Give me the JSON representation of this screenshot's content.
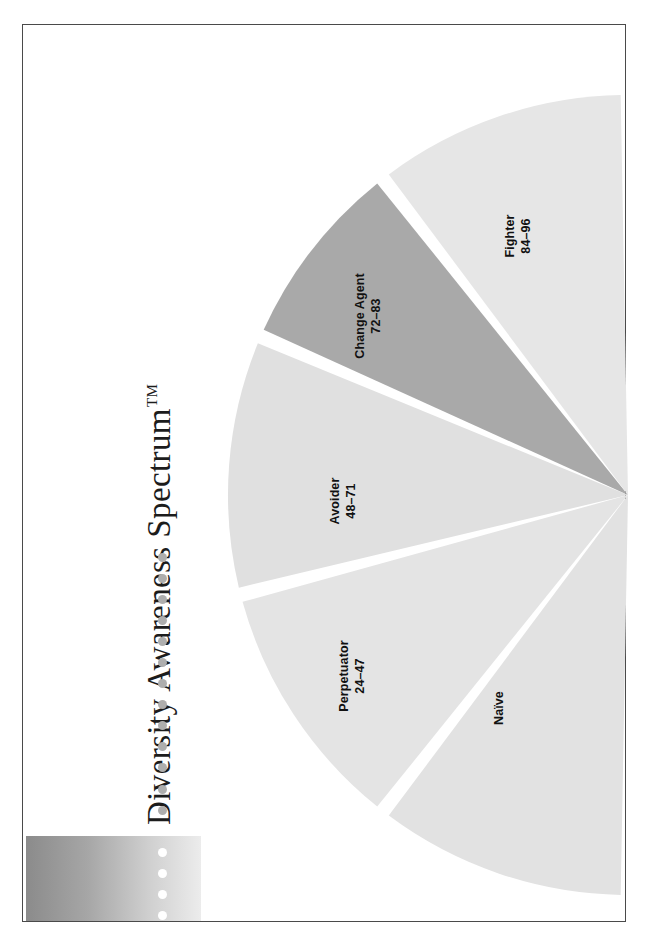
{
  "figure": {
    "title": "Diversity Awareness Spectrum",
    "title_suffix": "TM",
    "orientation": "rotated-90-ccw",
    "border_color": "#4a4a4a",
    "background_color": "#ffffff"
  },
  "gradient_bar": {
    "name": "spectrum-gradient-bar",
    "from_color": "#8e8e8e",
    "to_color": "#e8e8e8"
  },
  "dot_rule": {
    "name": "dotted-rule",
    "gray_color": "#aeaeae",
    "white_color": "#ffffff",
    "gray_dot_count": 13,
    "white_dot_count": 6
  },
  "chart_data": {
    "type": "pie",
    "title": "Diversity Awareness Spectrum",
    "xlabel": "",
    "ylabel": "",
    "legend": "none",
    "grid": false,
    "note": "Half-disc fan of five wedges opening to the left from an apex on the right edge; wedge sizes are proportional to the score ranges shown.",
    "categories": [
      "Naïve",
      "Perpetuator",
      "Avoider",
      "Change Agent",
      "Fighter"
    ],
    "labels": [
      {
        "name": "Naïve",
        "range": "",
        "range_low": null,
        "range_high": null
      },
      {
        "name": "Perpetuator",
        "range": "24–47",
        "range_low": 24,
        "range_high": 47
      },
      {
        "name": "Avoider",
        "range": "48–71",
        "range_high": 71,
        "range_low": 48
      },
      {
        "name": "Change Agent",
        "range": "72–83",
        "range_low": 72,
        "range_high": 83
      },
      {
        "name": "Fighter",
        "range": "84–96",
        "range_low": 84,
        "range_high": 96
      }
    ],
    "values": [
      34,
      34,
      34,
      26,
      34
    ],
    "colors": [
      "#e2e2e2",
      "#e4e4e4",
      "#e0e0e0",
      "#a9a9a9",
      "#e6e6e6"
    ],
    "slice_gap_color": "#ffffff"
  }
}
